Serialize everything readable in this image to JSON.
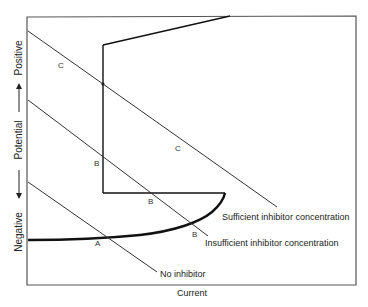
{
  "diagram": {
    "axes": {
      "x_label": "Current",
      "y_label_top": "Positive",
      "y_label_mid": "Potential",
      "y_label_bottom": "Negative"
    },
    "lines": [
      {
        "id": "sufficient",
        "label": "Sufficient inhibitor concentration",
        "point_label": "C"
      },
      {
        "id": "insufficient",
        "label": "Insufficient inhibitor concentration",
        "point_label": "B"
      },
      {
        "id": "none",
        "label": "No inhibitor",
        "point_label": "A"
      }
    ],
    "point_labels": {
      "c1": "C",
      "c2": "C",
      "b1": "B",
      "b2": "B",
      "b3": "B",
      "a1": "A"
    },
    "colors": {
      "line": "#333333",
      "frame": "#555555",
      "background": "#ffffff"
    }
  }
}
